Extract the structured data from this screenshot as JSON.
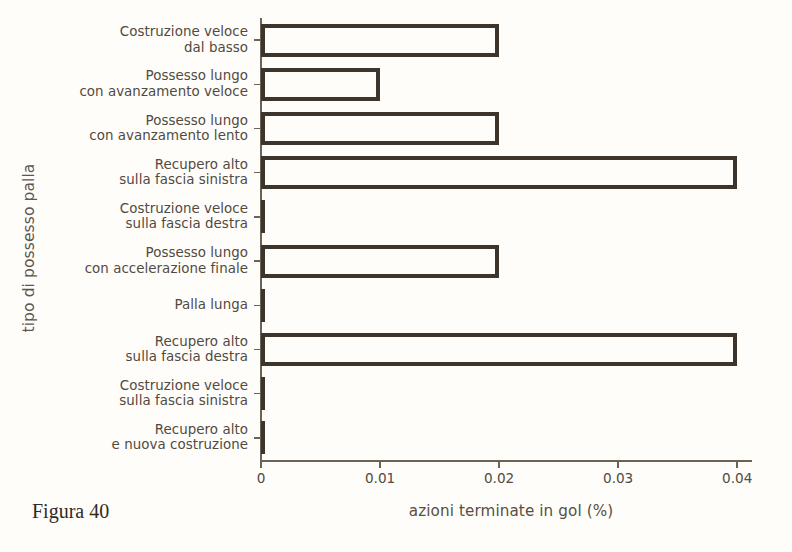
{
  "caption": "Figura 40",
  "chart_data": {
    "type": "bar",
    "orientation": "horizontal",
    "title": "",
    "xlabel": "azioni terminate in gol (%)",
    "ylabel": "tipo di possesso palla",
    "xlim": [
      0,
      0.042
    ],
    "xticks": [
      0,
      0.01,
      0.02,
      0.03,
      0.04
    ],
    "xticklabels": [
      "0",
      "0.01",
      "0.02",
      "0.03",
      "0.04"
    ],
    "grid": false,
    "legend": null,
    "bar_facecolor": "#fefdfa",
    "bar_edgecolor": "#3d352b",
    "axis_color": "#6b6356",
    "categories": [
      "Costruzione veloce dal basso",
      "Possesso lungo con avanzamento veloce",
      "Possesso lungo con avanzamento lento",
      "Recupero alto sulla fascia sinistra",
      "Costruzione veloce sulla fascia destra",
      "Possesso lungo con accelerazione finale",
      "Palla lunga",
      "Recupero alto sulla fascia destra",
      "Costruzione veloce sulla fascia sinistra",
      "Recupero alto e nuova costruzione"
    ],
    "category_lines": [
      [
        "Costruzione veloce",
        "dal basso"
      ],
      [
        "Possesso lungo",
        "con avanzamento veloce"
      ],
      [
        "Possesso lungo",
        "con avanzamento lento"
      ],
      [
        "Recupero alto",
        "sulla fascia sinistra"
      ],
      [
        "Costruzione veloce",
        "sulla fascia destra"
      ],
      [
        "Possesso lungo",
        "con accelerazione finale"
      ],
      [
        "Palla lunga",
        ""
      ],
      [
        "Recupero alto",
        "sulla fascia destra"
      ],
      [
        "Costruzione veloce",
        "sulla fascia sinistra"
      ],
      [
        "Recupero alto",
        "e nuova costruzione"
      ]
    ],
    "values": [
      0.02,
      0.01,
      0.02,
      0.04,
      0,
      0.02,
      0,
      0.04,
      0,
      0
    ]
  }
}
